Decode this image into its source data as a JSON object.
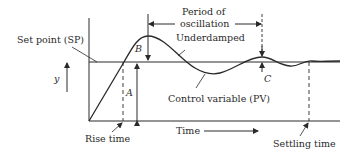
{
  "diagram": {
    "labels": {
      "set_point": "Set point (SP)",
      "period_line1": "Period of",
      "period_line2": "oscillation",
      "underdamped": "Underdamped",
      "control_variable": "Control variable (PV)",
      "y_axis": "y",
      "A": "A",
      "B": "B",
      "C": "C",
      "time": "Time",
      "rise_time": "Rise time",
      "settling_time": "Settling time"
    },
    "colors": {
      "line": "#2a2a2a",
      "background": "#ffffff"
    }
  }
}
